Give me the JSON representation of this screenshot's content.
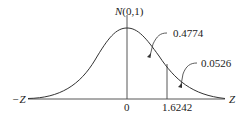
{
  "diagram": {
    "title_prefix": "N",
    "title_suffix": "(0,1)",
    "axis_left": "−Z",
    "axis_right": "Z",
    "tick_zero": "0",
    "tick_z": "1.6242",
    "area_center": "0.4774",
    "area_tail": "0.0526",
    "colors": {
      "line": "#333333",
      "background": "#ffffff"
    }
  }
}
